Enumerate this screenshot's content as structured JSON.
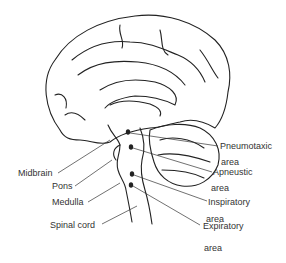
{
  "figure": {
    "labels": {
      "midbrain": "Midbrain",
      "pons": "Pons",
      "medulla": "Medulla",
      "spinal_cord": "Spinal cord",
      "pneumotaxic": "Pneumotaxic",
      "pneumotaxic_area": "area",
      "apneustic": "Apneustic",
      "apneustic_area": "area",
      "inspiratory": "Inspiratory",
      "inspiratory_area": "area",
      "expiratory": "Expiratory",
      "expiratory_area": "area"
    },
    "colors": {
      "line": "#222222",
      "text": "#333333",
      "background": "#ffffff"
    }
  }
}
